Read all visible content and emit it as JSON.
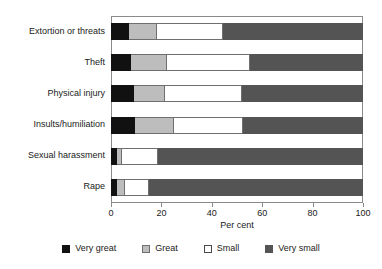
{
  "chart_data": {
    "type": "bar",
    "orientation": "horizontal",
    "stacked": true,
    "title": "",
    "xlabel": "Per cent",
    "ylabel": "",
    "xlim": [
      0,
      100
    ],
    "xticks": [
      0,
      20,
      40,
      60,
      80,
      100
    ],
    "xtick_labels": [
      "0",
      "20",
      "40",
      "60",
      "80",
      "100"
    ],
    "grid": false,
    "legend_position": "bottom",
    "categories": [
      "Extortion or threats",
      "Theft",
      "Physical injury",
      "Insults/humiliation",
      "Sexual harassment",
      "Rape"
    ],
    "series": [
      {
        "name": "Very great",
        "color": "#111111",
        "values": [
          7,
          8,
          9,
          9.5,
          2.5,
          2.5
        ]
      },
      {
        "name": "Great",
        "color": "#bdbdbd",
        "values": [
          11,
          14,
          12,
          15,
          1.5,
          2.5
        ]
      },
      {
        "name": "Small",
        "color": "#ffffff",
        "values": [
          26.5,
          33,
          31,
          28,
          14.5,
          10
        ]
      },
      {
        "name": "Very small",
        "color": "#545454",
        "values": [
          55.5,
          45,
          48,
          47.5,
          81.5,
          85
        ]
      }
    ]
  },
  "axis": {
    "x_title": "Per cent"
  },
  "legend": {
    "items": [
      {
        "label": "Very great",
        "key": "very-great"
      },
      {
        "label": "Great",
        "key": "great"
      },
      {
        "label": "Small",
        "key": "small"
      },
      {
        "label": "Very small",
        "key": "very-small"
      }
    ]
  }
}
